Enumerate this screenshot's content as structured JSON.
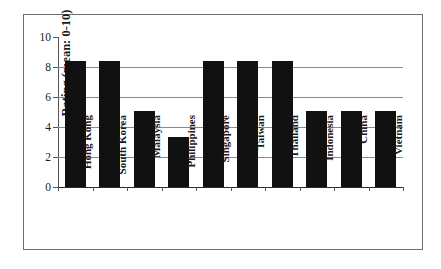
{
  "chart_data": {
    "type": "bar",
    "title": "",
    "xlabel": "",
    "ylabel": "Rating (mean: 0-10)",
    "categories": [
      "Hong Kong",
      "South Korea",
      "Malaysia",
      "Philippines",
      "Singapore",
      "Taiwan",
      "Thailand",
      "Indonesia",
      "China",
      "Vietnam"
    ],
    "values": [
      8.4,
      8.4,
      5.05,
      3.35,
      8.4,
      8.4,
      8.4,
      5.05,
      5.05,
      5.05
    ],
    "ylim": [
      0,
      10
    ],
    "ytick_labels": [
      "0",
      "2",
      "4",
      "6",
      "8",
      "10"
    ],
    "ytick_values": [
      0,
      2,
      4,
      6,
      8,
      10
    ],
    "gridlines": [
      2,
      4,
      6,
      8
    ],
    "grid": true,
    "legend": null,
    "bar_color": "#111111",
    "grid_color": "#8a8a8a",
    "axis_color": "#555555",
    "frame_color": "#6e6e6e",
    "background": "#ffffff"
  }
}
